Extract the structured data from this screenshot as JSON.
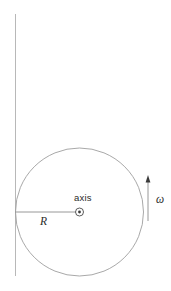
{
  "figure": {
    "background_color": "#ffffff",
    "line_color": "#9a9a9a",
    "text_color": "#2b2b2b",
    "width": 171,
    "height": 291
  },
  "labels": {
    "axis": "axis",
    "radius": "R",
    "angular_velocity": "ω"
  },
  "geometry": {
    "disk": {
      "center_x": 79.5,
      "center_y": 212,
      "radius": 64
    },
    "vertical_line": {
      "x": 15.5,
      "y_top": 14,
      "y_bottom": 276
    },
    "radius_line": {
      "x_start": 15.5,
      "x_end": 79.5,
      "y": 212
    },
    "axis_marker": {
      "cx": 79.5,
      "cy": 212,
      "outer_radius": 4,
      "inner_radius": 1.4,
      "symbol": "circled-dot"
    },
    "omega_arrow": {
      "x": 148,
      "y_tail": 221,
      "y_head": 176,
      "direction": "up"
    }
  }
}
